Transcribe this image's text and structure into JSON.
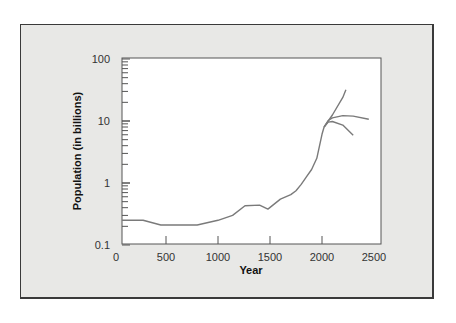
{
  "chart_data": {
    "type": "line",
    "title": "",
    "xlabel": "Year",
    "ylabel": "Population (in billions)",
    "xscale": "linear",
    "yscale": "log",
    "xlim": [
      0,
      2500
    ],
    "ylim": [
      0.1,
      100
    ],
    "x_ticks": [
      "0",
      "500",
      "1000",
      "1500",
      "2000",
      "2500"
    ],
    "y_ticks": [
      "0.1",
      "1",
      "10",
      "100"
    ],
    "grid": false,
    "legend": null,
    "series": [
      {
        "name": "Historical population",
        "x": [
          0,
          280,
          450,
          800,
          1000,
          1140,
          1260,
          1400,
          1480,
          1600,
          1700,
          1750,
          1800,
          1850,
          1900,
          1950,
          2000,
          2020
        ],
        "values": [
          0.25,
          0.25,
          0.21,
          0.21,
          0.25,
          0.3,
          0.43,
          0.44,
          0.38,
          0.55,
          0.65,
          0.75,
          0.95,
          1.26,
          1.65,
          2.5,
          6.1,
          8.0
        ]
      },
      {
        "name": "High projection",
        "x": [
          2020,
          2100,
          2200,
          2230
        ],
        "values": [
          8.0,
          12.5,
          24,
          32
        ]
      },
      {
        "name": "Medium projection",
        "x": [
          2020,
          2060,
          2100,
          2200,
          2300,
          2450
        ],
        "values": [
          8.0,
          10.2,
          11.2,
          12.2,
          12.0,
          10.7
        ]
      },
      {
        "name": "Low projection",
        "x": [
          2020,
          2060,
          2100,
          2200,
          2300
        ],
        "values": [
          8.0,
          9.6,
          9.8,
          8.6,
          5.9
        ]
      }
    ]
  },
  "axes": {
    "x_title": "Year",
    "y_title": "Population (in billions)"
  }
}
